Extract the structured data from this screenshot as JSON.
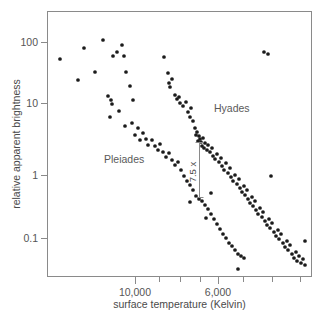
{
  "chart_data": {
    "type": "scatter",
    "title": "",
    "subtitle": "",
    "xlabel": "surface temperature (Kelvin)",
    "ylabel": "relative apparent brightness",
    "x_scale": "log-reversed",
    "y_scale": "log",
    "grid": false,
    "legend_position": "inline-annotations",
    "xlim": [
      14000,
      3900
    ],
    "ylim": [
      0.035,
      260
    ],
    "x_ticks": [
      {
        "value": 10000,
        "label": "10,000",
        "px": 135
      },
      {
        "value": 8600,
        "label": "",
        "px": 159
      },
      {
        "value": 7600,
        "label": "",
        "px": 180
      },
      {
        "value": 6800,
        "label": "",
        "px": 200
      },
      {
        "value": 6000,
        "label": "6,000",
        "px": 218
      },
      {
        "value": 5200,
        "label": "",
        "px": 243
      },
      {
        "value": 4400,
        "label": "",
        "px": 272
      },
      {
        "value": 3900,
        "label": "",
        "px": 300
      }
    ],
    "y_ticks": [
      {
        "value": 100,
        "label": "100",
        "px": 42
      },
      {
        "value": 10,
        "label": "10",
        "px": 103
      },
      {
        "value": 1,
        "label": "1",
        "px": 175
      },
      {
        "value": 0.1,
        "label": "0.1",
        "px": 238
      }
    ],
    "annotations": [
      {
        "name": "brightness-ratio",
        "text": "7.5 x",
        "rotation": -90,
        "line_x_px": 199,
        "line_y_top_px": 142,
        "line_y_bottom_px": 198,
        "label_x_px": 196,
        "label_y_px": 172,
        "meaning": "Hyades main sequence is 7.5 times brighter than Pleiades at the same surface temperature"
      }
    ],
    "series": [
      {
        "name": "Pleiades",
        "label": "Pleiades",
        "label_x_px": 104,
        "label_y_px": 163,
        "marker": "filled-circle",
        "color": "#1b1b1b",
        "points_px": [
          [
            60,
            59
          ],
          [
            78,
            80
          ],
          [
            84,
            48
          ],
          [
            95,
            72
          ],
          [
            103,
            40
          ],
          [
            110,
            117
          ],
          [
            111,
            100
          ],
          [
            108,
            96
          ],
          [
            112,
            104
          ],
          [
            119,
            111
          ],
          [
            113,
            56
          ],
          [
            117,
            52
          ],
          [
            122,
            45
          ],
          [
            124,
            56
          ],
          [
            126,
            72
          ],
          [
            130,
            86
          ],
          [
            133,
            100
          ],
          [
            125,
            126
          ],
          [
            132,
            123
          ],
          [
            135,
            135
          ],
          [
            138,
            128
          ],
          [
            140,
            140
          ],
          [
            143,
            133
          ],
          [
            146,
            139
          ],
          [
            148,
            145
          ],
          [
            152,
            140
          ],
          [
            155,
            146
          ],
          [
            158,
            150
          ],
          [
            160,
            144
          ],
          [
            163,
            152
          ],
          [
            166,
            157
          ],
          [
            169,
            153
          ],
          [
            172,
            160
          ],
          [
            175,
            165
          ],
          [
            178,
            162
          ],
          [
            181,
            170
          ],
          [
            184,
            176
          ],
          [
            187,
            181
          ],
          [
            190,
            185
          ],
          [
            193,
            190
          ],
          [
            196,
            196
          ],
          [
            199,
            199
          ],
          [
            202,
            201
          ],
          [
            205,
            205
          ],
          [
            208,
            209
          ],
          [
            211,
            214
          ],
          [
            206,
            218
          ],
          [
            214,
            219
          ],
          [
            217,
            224
          ],
          [
            220,
            229
          ],
          [
            223,
            234
          ],
          [
            226,
            238
          ],
          [
            229,
            243
          ],
          [
            232,
            246
          ],
          [
            235,
            250
          ],
          [
            238,
            254
          ],
          [
            241,
            256
          ],
          [
            244,
            258
          ]
        ]
      },
      {
        "name": "Hyades",
        "label": "Hyades",
        "label_x_px": 214,
        "label_y_px": 112,
        "marker": "filled-circle",
        "color": "#1b1b1b",
        "points_px": [
          [
            164,
            57
          ],
          [
            168,
            73
          ],
          [
            169,
            83
          ],
          [
            170,
            87
          ],
          [
            172,
            79
          ],
          [
            175,
            95
          ],
          [
            177,
            99
          ],
          [
            179,
            97
          ],
          [
            180,
            103
          ],
          [
            183,
            106
          ],
          [
            186,
            102
          ],
          [
            188,
            112
          ],
          [
            190,
            117
          ],
          [
            193,
            121
          ],
          [
            191,
            108
          ],
          [
            195,
            128
          ],
          [
            197,
            132
          ],
          [
            196,
            135
          ],
          [
            199,
            136
          ],
          [
            200,
            139
          ],
          [
            198,
            141
          ],
          [
            201,
            142
          ],
          [
            203,
            138
          ],
          [
            202,
            146
          ],
          [
            204,
            148
          ],
          [
            205,
            143
          ],
          [
            207,
            150
          ],
          [
            208,
            145
          ],
          [
            210,
            152
          ],
          [
            212,
            148
          ],
          [
            213,
            156
          ],
          [
            215,
            159
          ],
          [
            217,
            154
          ],
          [
            219,
            162
          ],
          [
            221,
            158
          ],
          [
            222,
            166
          ],
          [
            224,
            170
          ],
          [
            226,
            163
          ],
          [
            228,
            173
          ],
          [
            230,
            168
          ],
          [
            231,
            177
          ],
          [
            233,
            181
          ],
          [
            235,
            175
          ],
          [
            237,
            184
          ],
          [
            239,
            179
          ],
          [
            240,
            188
          ],
          [
            242,
            192
          ],
          [
            244,
            186
          ],
          [
            245,
            195
          ],
          [
            247,
            190
          ],
          [
            248,
            199
          ],
          [
            250,
            203
          ],
          [
            252,
            197
          ],
          [
            253,
            206
          ],
          [
            255,
            201
          ],
          [
            256,
            210
          ],
          [
            258,
            214
          ],
          [
            260,
            208
          ],
          [
            262,
            217
          ],
          [
            263,
            212
          ],
          [
            265,
            221
          ],
          [
            267,
            225
          ],
          [
            269,
            219
          ],
          [
            270,
            228
          ],
          [
            272,
            223
          ],
          [
            274,
            232
          ],
          [
            276,
            236
          ],
          [
            278,
            230
          ],
          [
            279,
            239
          ],
          [
            281,
            234
          ],
          [
            283,
            243
          ],
          [
            285,
            247
          ],
          [
            287,
            241
          ],
          [
            288,
            250
          ],
          [
            290,
            245
          ],
          [
            292,
            254
          ],
          [
            294,
            258
          ],
          [
            296,
            252
          ],
          [
            297,
            261
          ],
          [
            299,
            256
          ],
          [
            301,
            263
          ],
          [
            303,
            259
          ],
          [
            305,
            265
          ],
          [
            264,
            52
          ],
          [
            268,
            54
          ],
          [
            271,
            176
          ],
          [
            211,
            193
          ],
          [
            190,
            202
          ],
          [
            238,
            269
          ],
          [
            305,
            241
          ]
        ]
      }
    ]
  },
  "plot_geometry": {
    "frame_left_px": 47,
    "frame_right_px": 312,
    "frame_top_px": 11,
    "frame_bottom_px": 277,
    "width_px": 328,
    "height_px": 317
  },
  "colors": {
    "frame": "#8a8a8a",
    "text": "#4a4a4a",
    "point": "#1b1b1b",
    "background": "#ffffff"
  }
}
